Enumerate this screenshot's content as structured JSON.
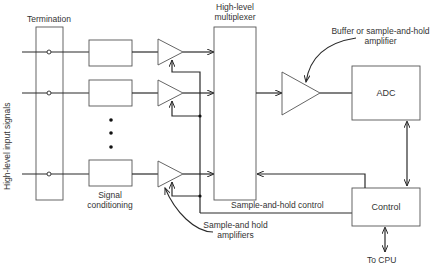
{
  "diagram": {
    "labels": {
      "termination": "Termination",
      "input_signals": "High-level input signals",
      "multiplexer_line1": "High-level",
      "multiplexer_line2": "multiplexer",
      "buffer_line1": "Buffer or sample-and-hold",
      "buffer_line2": "amplifier",
      "adc": "ADC",
      "control": "Control",
      "signal_conditioning_line1": "Signal",
      "signal_conditioning_line2": "conditioning",
      "sh_control": "Sample-and-hold control",
      "sh_amplifiers_line1": "Sample-and hold",
      "sh_amplifiers_line2": "amplifiers",
      "to_cpu": "To CPU",
      "ellipsis": "• • •"
    },
    "channels": [
      {
        "name": "channel-1"
      },
      {
        "name": "channel-2"
      },
      {
        "name": "channel-n"
      }
    ],
    "colors": {
      "line": "#2a2a2a",
      "box_stroke": "#555555",
      "text": "#333333"
    }
  }
}
